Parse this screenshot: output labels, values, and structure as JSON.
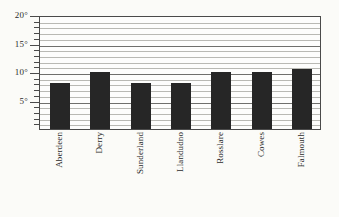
{
  "chart_data": {
    "type": "bar",
    "title": "",
    "subtitle": "",
    "xlabel": "",
    "ylabel": "",
    "categories": [
      "Aberdeen",
      "Derry",
      "Sunderland",
      "Llandudno",
      "Rosslare",
      "Cowes",
      "Falmouth"
    ],
    "values": [
      8,
      10,
      8,
      8,
      10,
      10,
      10.5
    ],
    "ylim": [
      0,
      20
    ],
    "y_ticks_major": [
      5,
      10,
      15,
      20
    ],
    "y_tick_labels": [
      "5°",
      "10°",
      "15°",
      "20°"
    ],
    "y_tick_step_minor": 1,
    "grid": true,
    "grid_orientation": "horizontal",
    "legend": "none",
    "bar_color": "#262626",
    "axis_color": "#4a4a4a",
    "grid_color": "#b9b9b4",
    "background_color": "#fbfbf8"
  }
}
